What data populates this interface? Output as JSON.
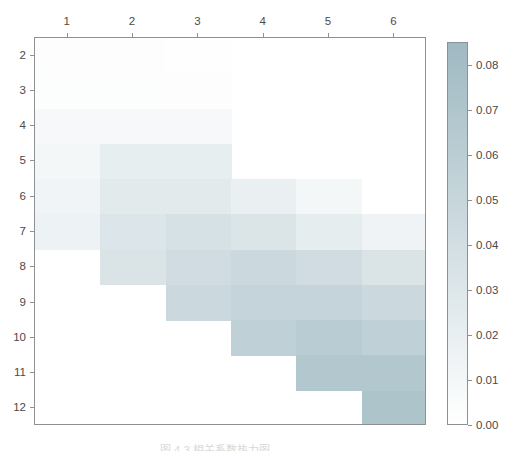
{
  "figure": {
    "caption": "图 4-3  相关系数热力图"
  },
  "chart_data": {
    "type": "heatmap",
    "title": "",
    "xlabel": "",
    "ylabel": "",
    "xticklabels": [
      "1",
      "2",
      "3",
      "4",
      "5",
      "6"
    ],
    "yticklabels": [
      "2",
      "3",
      "4",
      "5",
      "6",
      "7",
      "8",
      "9",
      "10",
      "11",
      "12"
    ],
    "xlim": [
      0.5,
      6.5
    ],
    "ylim_inverted": [
      1.5,
      12.5
    ],
    "grid": false,
    "colormap": {
      "name": "white-to-teal",
      "low_color": "#ffffff",
      "high_color": "#9fb9c2",
      "vmin": 0.0,
      "vmax": 0.085
    },
    "colorbar": {
      "position": "right",
      "tick_labels": [
        "0.08",
        "0.07",
        "0.06",
        "0.05",
        "0.04",
        "0.03",
        "0.02",
        "0.01",
        "0.00"
      ],
      "tick_values": [
        0.08,
        0.07,
        0.06,
        0.05,
        0.04,
        0.03,
        0.02,
        0.01,
        0.0
      ]
    },
    "columns": [
      {
        "x": 1,
        "row_start": 1.5,
        "row_end": 7.5,
        "cells": [
          {
            "row": 2,
            "value": 0.002
          },
          {
            "row": 3,
            "value": 0.003
          },
          {
            "row": 4,
            "value": 0.008
          },
          {
            "row": 5,
            "value": 0.01
          },
          {
            "row": 6,
            "value": 0.013
          },
          {
            "row": 7,
            "value": 0.016
          }
        ]
      },
      {
        "x": 2,
        "row_start": 1.5,
        "row_end": 8.5,
        "cells": [
          {
            "row": 2,
            "value": 0.002
          },
          {
            "row": 3,
            "value": 0.003
          },
          {
            "row": 4,
            "value": 0.008
          },
          {
            "row": 5,
            "value": 0.021
          },
          {
            "row": 6,
            "value": 0.026
          },
          {
            "row": 7,
            "value": 0.031
          },
          {
            "row": 8,
            "value": 0.033
          }
        ]
      },
      {
        "x": 3,
        "row_start": 1.5,
        "row_end": 9.5,
        "cells": [
          {
            "row": 2,
            "value": 0.001
          },
          {
            "row": 3,
            "value": 0.002
          },
          {
            "row": 4,
            "value": 0.008
          },
          {
            "row": 5,
            "value": 0.021
          },
          {
            "row": 6,
            "value": 0.026
          },
          {
            "row": 7,
            "value": 0.036
          },
          {
            "row": 8,
            "value": 0.042
          },
          {
            "row": 9,
            "value": 0.046
          }
        ]
      },
      {
        "x": 4,
        "row_start": 5.5,
        "row_end": 10.5,
        "cells": [
          {
            "row": 6,
            "value": 0.019
          },
          {
            "row": 7,
            "value": 0.032
          },
          {
            "row": 8,
            "value": 0.046
          },
          {
            "row": 9,
            "value": 0.052
          },
          {
            "row": 10,
            "value": 0.057
          }
        ]
      },
      {
        "x": 5,
        "row_start": 5.5,
        "row_end": 11.5,
        "cells": [
          {
            "row": 6,
            "value": 0.01
          },
          {
            "row": 7,
            "value": 0.022
          },
          {
            "row": 8,
            "value": 0.042
          },
          {
            "row": 9,
            "value": 0.052
          },
          {
            "row": 10,
            "value": 0.062
          },
          {
            "row": 11,
            "value": 0.068
          }
        ]
      },
      {
        "x": 6,
        "row_start": 6.5,
        "row_end": 12.5,
        "cells": [
          {
            "row": 7,
            "value": 0.014
          },
          {
            "row": 8,
            "value": 0.033
          },
          {
            "row": 9,
            "value": 0.046
          },
          {
            "row": 10,
            "value": 0.057
          },
          {
            "row": 11,
            "value": 0.068
          },
          {
            "row": 12,
            "value": 0.072
          }
        ]
      }
    ]
  }
}
